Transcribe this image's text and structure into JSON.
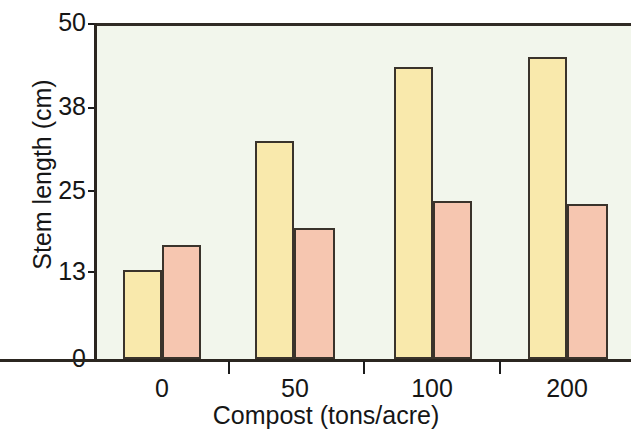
{
  "chart_data": {
    "type": "bar",
    "title": "",
    "xlabel": "Compost (tons/acre)",
    "ylabel": "Stem length (cm)",
    "categories": [
      "0",
      "50",
      "100",
      "200"
    ],
    "series": [
      {
        "name": "series-a",
        "color": "#f9e9ac",
        "values": [
          13.3,
          32.5,
          43.5,
          45.0
        ]
      },
      {
        "name": "series-b",
        "color": "#f6c6b0",
        "values": [
          17.0,
          19.5,
          23.5,
          23.0
        ]
      }
    ],
    "ylim": [
      0,
      50
    ],
    "yticks": [
      "0",
      "13",
      "25",
      "38",
      "50"
    ],
    "ytick_values": [
      0,
      13,
      25,
      38,
      50
    ],
    "xticks": [
      "0",
      "50",
      "100",
      "200"
    ],
    "grid": false,
    "legend": "none",
    "plot_background": "#f2f6ec",
    "axis_color": "#2b2620",
    "bar_edge_color": "#3a332b"
  },
  "axes": {
    "y_title": "Stem length (cm)",
    "x_title": "Compost (tons/acre)",
    "y_tick_labels": [
      "50",
      "38",
      "25",
      "13",
      "0"
    ],
    "x_tick_labels": [
      "0",
      "50",
      "100",
      "200"
    ]
  }
}
